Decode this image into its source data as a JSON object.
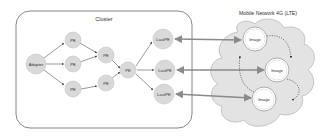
{
  "cluster": {
    "title": "Cluster",
    "adapter": "Adapter",
    "pe_label": "PE",
    "nodes": {
      "pe1": "PE",
      "pe2": "PE",
      "pe3": "PE",
      "pe4": "PE",
      "pe5": "PE",
      "pe6": "PE"
    },
    "last_pes": [
      "LastPE",
      "LastPE",
      "LastPE"
    ]
  },
  "network": {
    "title": "Mobile Network 4G (LTE)",
    "images": [
      "Image",
      "Image",
      "Image"
    ]
  },
  "colors": {
    "node_fill": "#d9d9d9",
    "node_stroke": "#c4c4c4",
    "cloud_fill": "#e3e3e3",
    "cloud_stroke": "#b5b5b5",
    "edge": "#555555",
    "arrow": "#888888",
    "cluster_border": "#666666"
  }
}
